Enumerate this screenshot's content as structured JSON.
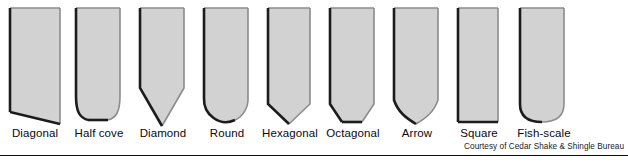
{
  "figure": {
    "credit": "Courtesy of Cedar Shake & Shingle Bureau",
    "colors": {
      "shape_fill": "#d2d2d2",
      "shape_fill_light": "#e0e0e0",
      "shape_outline_dark": "#1c1c1c",
      "shape_outline_light": "#8c8c8c",
      "label_text": "#0a0a0a",
      "credit_text": "#1a1a1a",
      "rule": "#0d0d0d",
      "background": "#ffffff"
    },
    "shapes": [
      {
        "id": "diagonal",
        "label": "Diagonal",
        "description": "Rectangle with a bottom edge slanting down to the right",
        "x": 8,
        "width": 52,
        "label_x": 4,
        "label_width": 62
      },
      {
        "id": "half-cove",
        "label": "Half cove",
        "description": "Rectangle with concave cove curves at both bottom corners",
        "x": 74,
        "width": 48,
        "label_x": 68,
        "label_width": 62
      },
      {
        "id": "diamond",
        "label": "Diamond",
        "description": "Rectangle ending in a deep pointed V at the bottom",
        "x": 138,
        "width": 48,
        "label_x": 132,
        "label_width": 62
      },
      {
        "id": "round",
        "label": "Round",
        "description": "Rectangle with a full semicircular rounded bottom",
        "x": 202,
        "width": 48,
        "label_x": 196,
        "label_width": 62
      },
      {
        "id": "hexagonal",
        "label": "Hexagonal",
        "description": "Rectangle with a shallow pointed hexagon bottom",
        "x": 266,
        "width": 46,
        "label_x": 258,
        "label_width": 64
      },
      {
        "id": "octagonal",
        "label": "Octagonal",
        "description": "Rectangle with clipped bottom corners and a flat bottom edge",
        "x": 328,
        "width": 48,
        "label_x": 322,
        "label_width": 62
      },
      {
        "id": "arrow",
        "label": "Arrow",
        "description": "Rectangle with concave curves sweeping to a center point",
        "x": 392,
        "width": 48,
        "label_x": 386,
        "label_width": 62
      },
      {
        "id": "square",
        "label": "Square",
        "description": "Plain rectangle with a straight flat bottom edge",
        "x": 456,
        "width": 44,
        "label_x": 448,
        "label_width": 62
      },
      {
        "id": "fish-scale",
        "label": "Fish-scale",
        "description": "Rectangle with softly rounded bottom corners",
        "x": 518,
        "width": 48,
        "label_x": 512,
        "label_width": 64
      }
    ]
  }
}
